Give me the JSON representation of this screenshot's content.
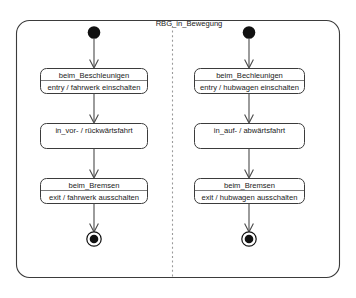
{
  "diagram": {
    "kind": "uml-state-machine",
    "title": "RBG_in_Bewegung",
    "background_color": "#ffffff",
    "line_color": "#3b3b3b",
    "text_color": "#1a1a1a",
    "divider_color": "#9a9a9a",
    "node_color": "#111111",
    "regions": [
      {
        "id": "region-left",
        "name": "fahrwerk-region",
        "initial_node_label": "initial-state",
        "final_node_label": "final-state",
        "states": [
          {
            "id": "left-state-1",
            "title": "beim_Beschleunigen",
            "action": "entry / fahrwerk einschalten",
            "has_action": true
          },
          {
            "id": "left-state-2",
            "title": "in_vor- / rückwärtsfahrt",
            "action": "",
            "has_action": false
          },
          {
            "id": "left-state-3",
            "title": "beim_Bremsen",
            "action": "exit / fahrwerk ausschalten",
            "has_action": true
          }
        ]
      },
      {
        "id": "region-right",
        "name": "hubwagen-region",
        "initial_node_label": "initial-state",
        "final_node_label": "final-state",
        "states": [
          {
            "id": "right-state-1",
            "title": "beim_Bechleunigen",
            "action": "entry / hubwagen einschalten",
            "has_action": true
          },
          {
            "id": "right-state-2",
            "title": "in_auf- / abwärtsfahrt",
            "action": "",
            "has_action": false
          },
          {
            "id": "right-state-3",
            "title": "beim_Bremsen",
            "action": "exit / hubwagen ausschalten",
            "has_action": true
          }
        ]
      }
    ]
  }
}
